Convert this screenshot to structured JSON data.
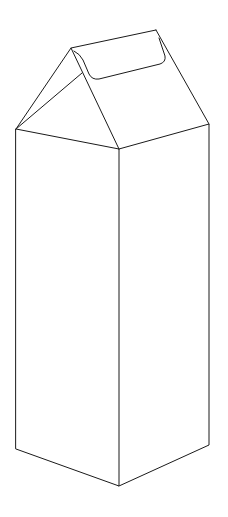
{
  "illustration": {
    "subject": "milk carton line drawing",
    "stroke_color": "#1a1a1a",
    "background": "#ffffff"
  }
}
